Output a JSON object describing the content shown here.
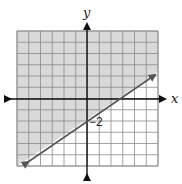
{
  "chart_data": {
    "type": "line",
    "title": "",
    "xlabel": "x",
    "ylabel": "y",
    "xlim": [
      -6,
      6
    ],
    "ylim": [
      -6,
      6
    ],
    "grid": true,
    "grid_step": 1,
    "series": [
      {
        "name": "boundary line y = (2/3)x - 2",
        "style": "solid",
        "slope": 0.6667,
        "intercept": -2,
        "x": [
          -5.2,
          0,
          3,
          5.8
        ],
        "y": [
          -5.47,
          -2,
          0,
          1.87
        ]
      }
    ],
    "shaded_region": "above line (y >= (2/3)x - 2)",
    "annotations": [
      {
        "text": "-2",
        "x": 0,
        "y": -2
      }
    ],
    "colors": {
      "shade": "#d9d9d9",
      "grid": "#8a8a8a",
      "axis": "#111111",
      "line": "#555555"
    }
  },
  "labels": {
    "x_axis": "x",
    "y_axis": "y",
    "intercept": "−2"
  }
}
